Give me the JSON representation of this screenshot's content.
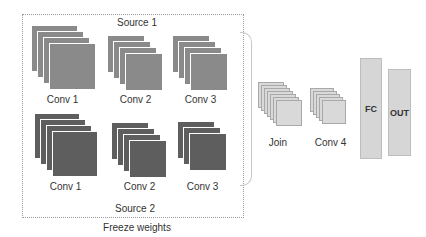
{
  "diagram": {
    "frozen_group": {
      "caption": "Freeze weights",
      "sources": [
        {
          "label": "Source 1",
          "color": "#8a8a8a",
          "layers": [
            {
              "label": "Conv 1",
              "count": 4
            },
            {
              "label": "Conv 2",
              "count": 4
            },
            {
              "label": "Conv 3",
              "count": 4
            }
          ]
        },
        {
          "label": "Source 2",
          "color": "#5e5e5e",
          "layers": [
            {
              "label": "Conv 1",
              "count": 4
            },
            {
              "label": "Conv 2",
              "count": 4
            },
            {
              "label": "Conv 3",
              "count": 3
            }
          ]
        }
      ]
    },
    "trainable": [
      {
        "label": "Join",
        "type": "stack",
        "count": 7,
        "color": "#d9d9d9"
      },
      {
        "label": "Conv 4",
        "type": "stack",
        "count": 5,
        "color": "#d9d9d9"
      },
      {
        "label": "FC",
        "type": "bar",
        "color": "#d6d6d6"
      },
      {
        "label": "OUT",
        "type": "bar",
        "color": "#d6d6d6"
      }
    ]
  }
}
